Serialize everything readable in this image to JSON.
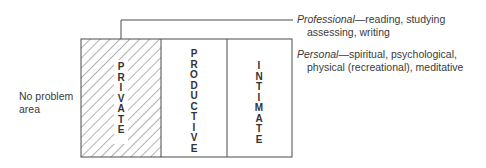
{
  "diagram": {
    "left_label": {
      "line1": "No problem",
      "line2": "area"
    },
    "columns": [
      {
        "id": "private",
        "label": "PRIVATE",
        "hatched": true
      },
      {
        "id": "productive",
        "label": "PRODUCTIVE",
        "hatched": false
      },
      {
        "id": "intimate",
        "label": "INTIMATE",
        "hatched": false
      }
    ],
    "annotations": {
      "professional": {
        "term": "Professional",
        "dash": "—",
        "line1_rest": "reading, studying",
        "line2": "assessing, writing"
      },
      "personal": {
        "term": "Personal",
        "dash": "—",
        "line1_rest": "spiritual, psychological,",
        "line2": "physical (recreational), meditative"
      }
    },
    "colors": {
      "line": "#4a4a4a",
      "text": "#333333",
      "background": "#ffffff"
    }
  }
}
